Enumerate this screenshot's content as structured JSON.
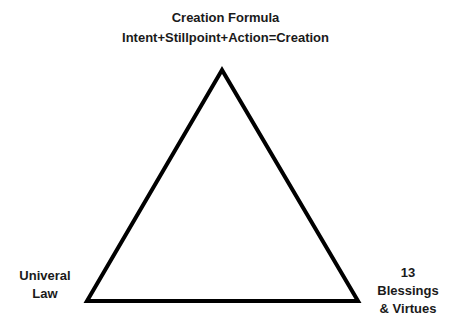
{
  "diagram": {
    "title": "Creation Formula",
    "subtitle": "Intent+Stillpoint+Action=Creation",
    "shape": "triangle",
    "vertices": {
      "top": {
        "x": 222,
        "y": 70
      },
      "bottom_left": {
        "x": 87,
        "y": 301
      },
      "bottom_right": {
        "x": 358,
        "y": 301
      }
    },
    "stroke_color": "#000000",
    "left_label": {
      "line1": "Univeral",
      "line2": "Law"
    },
    "right_label": {
      "line1": "13",
      "line2": "Blessings",
      "line3": "& Virtues"
    }
  }
}
